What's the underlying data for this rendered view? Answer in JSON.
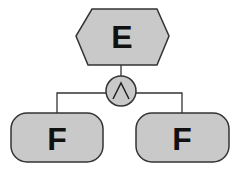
{
  "diagram": {
    "type": "and-decomposition-tree",
    "root": {
      "label": "E",
      "shape": "hexagon"
    },
    "gate": {
      "type": "AND",
      "symbol": "∧",
      "shape": "circle"
    },
    "children": [
      {
        "label": "F",
        "shape": "rounded-rectangle"
      },
      {
        "label": "F",
        "shape": "rounded-rectangle"
      }
    ],
    "colors": {
      "node_fill": "#c9c9c9",
      "stroke": "#333333",
      "text": "#111111",
      "background": "#ffffff"
    }
  }
}
